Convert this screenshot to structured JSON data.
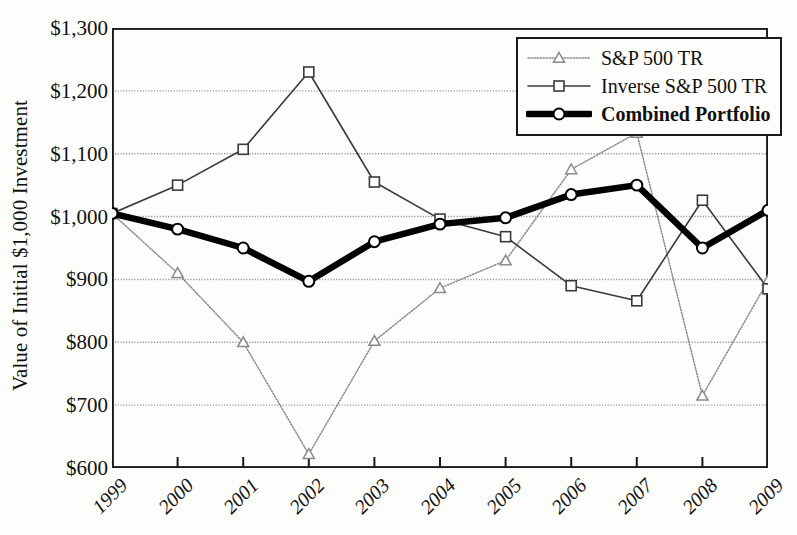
{
  "chart_data": {
    "type": "line",
    "title": "",
    "xlabel": "",
    "ylabel": "Value of Initial $1,000 Investment",
    "categories": [
      "1999",
      "2000",
      "2001",
      "2002",
      "2003",
      "2004",
      "2005",
      "2006",
      "2007",
      "2008",
      "2009"
    ],
    "ylim": [
      600,
      1300
    ],
    "ytick_values": [
      600,
      700,
      800,
      900,
      1000,
      1100,
      1200,
      1300
    ],
    "ytick_labels": [
      "$600",
      "$700",
      "$800",
      "$900",
      "$1,000",
      "$1,100",
      "$1,200",
      "$1,300"
    ],
    "grid": true,
    "legend_position": "top-right",
    "series": [
      {
        "name": "S&P 500 TR",
        "marker": "triangle",
        "line_style": "dotted",
        "color": "#8a8a8a",
        "values": [
          1005,
          910,
          800,
          622,
          802,
          886,
          930,
          1075,
          1133,
          715,
          898
        ]
      },
      {
        "name": "Inverse S&P 500 TR",
        "marker": "square",
        "line_style": "solid",
        "color": "#3a3a3a",
        "values": [
          1005,
          1050,
          1107,
          1230,
          1055,
          996,
          968,
          890,
          866,
          1026,
          885
        ]
      },
      {
        "name": "Combined Portfolio",
        "marker": "circle",
        "line_style": "solid-thick",
        "color": "#000000",
        "values": [
          1005,
          980,
          950,
          897,
          960,
          988,
          998,
          1035,
          1050,
          950,
          1010
        ]
      }
    ]
  },
  "legend": {
    "items": [
      {
        "label": "S&P 500 TR",
        "bold": false
      },
      {
        "label": "Inverse S&P 500 TR",
        "bold": false
      },
      {
        "label": "Combined Portfolio",
        "bold": true
      }
    ]
  },
  "axes": {
    "frame_color": "#1a1a1a",
    "gridline_color": "#9a9a9a",
    "background": "#fdfdfb"
  }
}
